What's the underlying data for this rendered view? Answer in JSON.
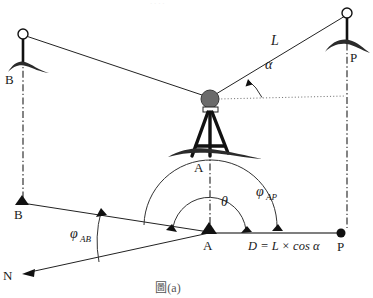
{
  "figure": {
    "caption": "圖(a)",
    "title_fragment": ""
  },
  "labels": {
    "target_b_upper": "B",
    "target_p_upper": "P",
    "instrument_station": "A",
    "point_b_lower": "B",
    "point_a_lower": "A",
    "point_p_lower": "P",
    "north": "N",
    "slope_distance": "L",
    "vertical_angle": "α",
    "horizontal_angle": "θ",
    "azimuth_ap": "φ",
    "azimuth_ap_sub": "AP",
    "azimuth_ab": "φ",
    "azimuth_ab_sub": "AB",
    "horizontal_distance_formula": "D = L × cos α"
  },
  "icons": {
    "target_b": "prism-target-icon",
    "target_p": "prism-target-icon",
    "instrument": "theodolite-icon",
    "station_marker": "triangle-control-point-icon",
    "point_marker": "filled-dot-icon",
    "north_arrow": "north-arrow-icon"
  },
  "geometry": {
    "station_a": {
      "x": 209,
      "y": 233
    },
    "point_p": {
      "x": 341,
      "y": 233
    },
    "point_b": {
      "x": 22,
      "y": 203
    },
    "instrument_head": {
      "x": 210,
      "y": 99
    },
    "target_b_circle": {
      "x": 23,
      "y": 34
    },
    "target_p_circle": {
      "x": 347,
      "y": 13
    },
    "north_tip": {
      "x": 25,
      "y": 274
    },
    "theta_arc_radius": 36,
    "phi_ap_arc_radius": 66,
    "phi_ab_arc_radius": 113
  },
  "colors": {
    "line": "#222222",
    "ground": "#555555",
    "instrument_head": "#6b6b6b",
    "background": "#ffffff",
    "caption": "#555555"
  }
}
